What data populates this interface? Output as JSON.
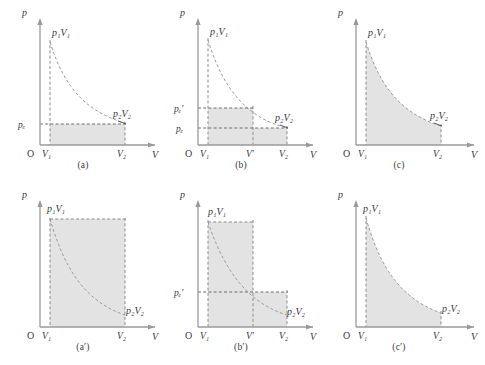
{
  "figure": {
    "caption": "",
    "axis": {
      "y_label": "p",
      "x_label": "V",
      "origin_label": "O"
    },
    "common_labels": {
      "p1V1": "p₁V₁",
      "p2V2": "p₂V₂",
      "V1": "V₁",
      "V2": "V₂",
      "Vprime": "V′",
      "pe": "pₑ",
      "pe_prime": "pₑ′"
    },
    "colors": {
      "fill": "#e3e3e3",
      "stroke": "#8c8c8c",
      "axis": "#9a9a9a",
      "text": "#3a3a3a"
    }
  },
  "panels": [
    {
      "id": "a",
      "label": "(a)",
      "process": "single-step irreversible expansion against constant external pressure",
      "shaded_regions": [
        {
          "x_from": "V₁",
          "x_to": "V₂",
          "p_level": "pₑ"
        }
      ],
      "axis_ticks_x": [
        "V₁",
        "V₂"
      ],
      "axis_ticks_y": [
        "pₑ"
      ],
      "point_labels": [
        "p₁V₁",
        "p₂V₂"
      ],
      "curve": "isotherm"
    },
    {
      "id": "b",
      "label": "(b)",
      "process": "two-step irreversible expansion",
      "shaded_regions": [
        {
          "x_from": "V₁",
          "x_to": "V′",
          "p_level": "pₑ′"
        },
        {
          "x_from": "V₁",
          "x_to": "V₂",
          "p_level": "pₑ"
        }
      ],
      "axis_ticks_x": [
        "V₁",
        "V′",
        "V₂"
      ],
      "axis_ticks_y": [
        "pₑ′",
        "pₑ"
      ],
      "point_labels": [
        "p₁V₁",
        "p₂V₂"
      ],
      "curve": "isotherm"
    },
    {
      "id": "c",
      "label": "(c)",
      "process": "reversible isothermal expansion",
      "shaded_regions": [
        {
          "x_from": "V₁",
          "x_to": "V₂",
          "p_level": "curve"
        }
      ],
      "axis_ticks_x": [
        "V₁",
        "V₂"
      ],
      "axis_ticks_y": [],
      "point_labels": [
        "p₁V₁",
        "p₂V₂"
      ],
      "curve": "isotherm"
    },
    {
      "id": "a-prime",
      "label": "(a′)",
      "process": "single-step irreversible compression against constant external pressure",
      "shaded_regions": [
        {
          "x_from": "V₁",
          "x_to": "V₂",
          "p_level": "p₁"
        }
      ],
      "axis_ticks_x": [
        "V₁",
        "V₂"
      ],
      "axis_ticks_y": [],
      "point_labels": [
        "p₁V₁",
        "p₂V₂"
      ],
      "curve": "isotherm"
    },
    {
      "id": "b-prime",
      "label": "(b′)",
      "process": "two-step irreversible compression",
      "shaded_regions": [
        {
          "x_from": "V₁",
          "x_to": "V′",
          "p_level": "p₁"
        },
        {
          "x_from": "V₁",
          "x_to": "V₂",
          "p_level": "pₑ′"
        }
      ],
      "axis_ticks_x": [
        "V₁",
        "V′",
        "V₂"
      ],
      "axis_ticks_y": [
        "pₑ′"
      ],
      "point_labels": [
        "p₁V₁",
        "p₂V₂"
      ],
      "curve": "isotherm"
    },
    {
      "id": "c-prime",
      "label": "(c′)",
      "process": "reversible isothermal compression",
      "shaded_regions": [
        {
          "x_from": "V₁",
          "x_to": "V₂",
          "p_level": "curve"
        }
      ],
      "axis_ticks_x": [
        "V₁",
        "V₂"
      ],
      "axis_ticks_y": [],
      "point_labels": [
        "p₁V₁",
        "p₂V₂"
      ],
      "curve": "isotherm"
    }
  ]
}
